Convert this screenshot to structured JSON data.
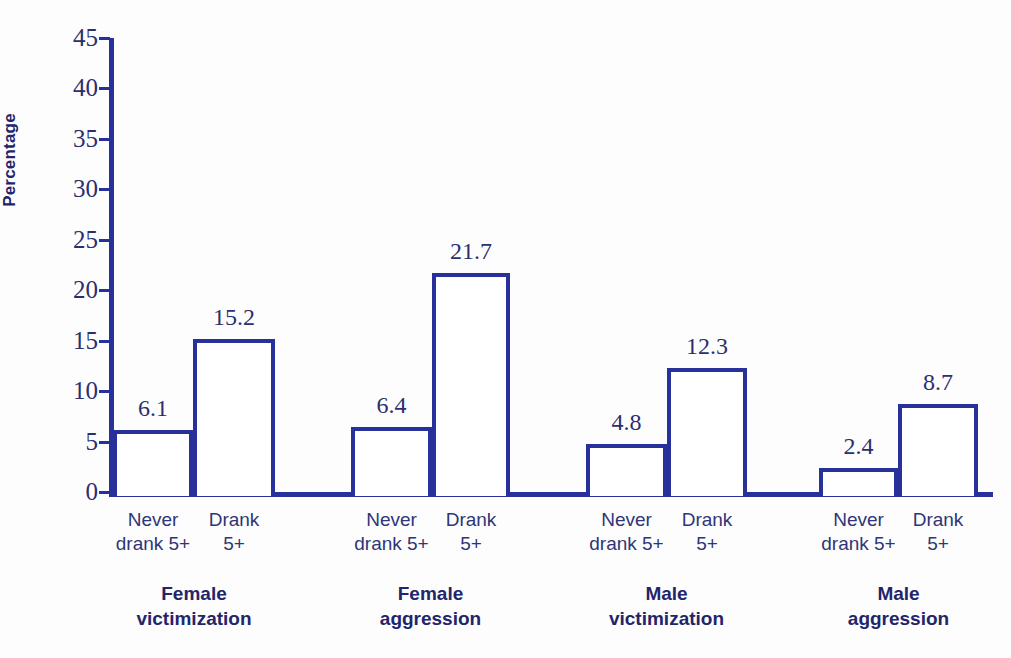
{
  "chart_data": {
    "type": "bar",
    "title": "",
    "xlabel": "",
    "ylabel": "Percentage",
    "ylim": [
      0,
      45
    ],
    "ytick_step": 5,
    "yticks": [
      45,
      40,
      35,
      30,
      25,
      20,
      15,
      10,
      5,
      0
    ],
    "grid": false,
    "legend": "none",
    "categories": [
      "Never drank 5+",
      "Drank 5+",
      "Never drank 5+",
      "Drank 5+",
      "Never drank 5+",
      "Drank 5+",
      "Never drank 5+",
      "Drank 5+"
    ],
    "values": [
      6.1,
      15.2,
      6.4,
      21.7,
      4.8,
      12.3,
      2.4,
      8.7
    ],
    "value_labels": [
      "6.1",
      "15.2",
      "6.4",
      "21.7",
      "4.8",
      "12.3",
      "2.4",
      "8.7"
    ],
    "groups": [
      {
        "label_line1": "Female",
        "label_line2": "victimization",
        "bars": [
          0,
          1
        ]
      },
      {
        "label_line1": "Female",
        "label_line2": "aggression",
        "bars": [
          2,
          3
        ]
      },
      {
        "label_line1": "Male",
        "label_line2": "victimization",
        "bars": [
          4,
          5
        ]
      },
      {
        "label_line1": "Male",
        "label_line2": "aggression",
        "bars": [
          6,
          7
        ]
      }
    ],
    "bar_style": {
      "fill": "#ffffff",
      "stroke": "#27309b",
      "stroke_width_px": 4
    },
    "colors": {
      "axis": "#27309b",
      "tick_text": "#2b2f6d",
      "category_text": "#2f3577",
      "group_text": "#23256b",
      "background": "#fdfdfe"
    }
  },
  "y_axis": {
    "title": "Percentage",
    "ticks": [
      {
        "label": "45",
        "value": 45
      },
      {
        "label": "40",
        "value": 40
      },
      {
        "label": "35",
        "value": 35
      },
      {
        "label": "30",
        "value": 30
      },
      {
        "label": "25",
        "value": 25
      },
      {
        "label": "20",
        "value": 20
      },
      {
        "label": "15",
        "value": 15
      },
      {
        "label": "10",
        "value": 10
      },
      {
        "label": "5",
        "value": 5
      },
      {
        "label": "0",
        "value": 0
      }
    ]
  },
  "x_axis": {
    "tick_labels": [
      {
        "line1": "Never",
        "line2": "drank 5+"
      },
      {
        "line1": "Drank",
        "line2": "5+"
      },
      {
        "line1": "Never",
        "line2": "drank 5+"
      },
      {
        "line1": "Drank",
        "line2": "5+"
      },
      {
        "line1": "Never",
        "line2": "drank 5+"
      },
      {
        "line1": "Drank",
        "line2": "5+"
      },
      {
        "line1": "Never",
        "line2": "drank 5+"
      },
      {
        "line1": "Drank",
        "line2": "5+"
      }
    ]
  },
  "artifacts": {
    "top_cropped_text": "",
    "bottom_cropped_text": ""
  }
}
